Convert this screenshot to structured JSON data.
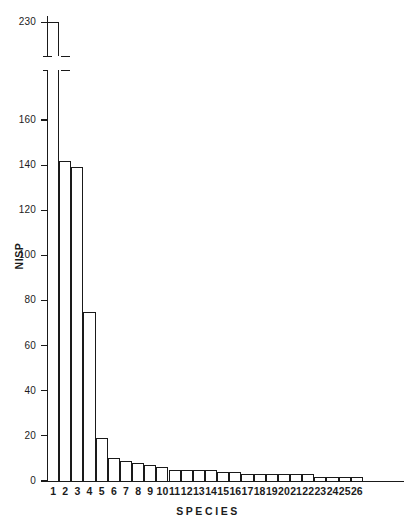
{
  "chart_data": {
    "type": "bar",
    "title": "",
    "xlabel": "SPECIES",
    "ylabel": "NISP",
    "categories": [
      "1",
      "2",
      "3",
      "4",
      "5",
      "6",
      "7",
      "8",
      "9",
      "10",
      "11",
      "12",
      "13",
      "14",
      "15",
      "16",
      "17",
      "18",
      "19",
      "20",
      "21",
      "22",
      "23",
      "24",
      "25",
      "26"
    ],
    "values": [
      230,
      142,
      139,
      75,
      19,
      10,
      9,
      8,
      7,
      6,
      5,
      5,
      5,
      5,
      4,
      4,
      3,
      3,
      3,
      3,
      3,
      3,
      2,
      2,
      2,
      2
    ],
    "ylim": [
      0,
      160
    ],
    "yticks": [
      0,
      20,
      40,
      60,
      80,
      100,
      120,
      140,
      160
    ],
    "ytick_labels": [
      "0",
      "20",
      "40",
      "60",
      "80",
      "100",
      "120",
      "140",
      "160"
    ],
    "broken_axis": {
      "present": true,
      "upper_tick_value": 230,
      "upper_tick_label": "230",
      "break_below_value": 160,
      "note": "bar 1 exceeds the axis; y-axis is broken between 160 and 230"
    },
    "grid": false,
    "legend": false,
    "bar_style": {
      "fill": "#ffffff",
      "outline": "#1a1a1a"
    }
  }
}
